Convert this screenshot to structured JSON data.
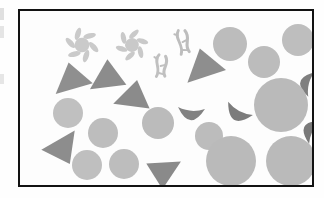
{
  "figure": {
    "title": "",
    "caption": "",
    "frame": {
      "x": 18,
      "y": 9,
      "width": 296,
      "height": 178,
      "border_color": "#121212",
      "border_width": 2,
      "background": "#fdfdfd"
    },
    "palette": {
      "light_gray": "#b9b9b9",
      "light_gray_2": "#c1c1c1",
      "mid_gray": "#8f8f8f",
      "dark_gray": "#777777",
      "pale_gray": "#cfcfcf",
      "page_background": "#ffffff",
      "artifact_gray": "#d9d9d9"
    },
    "legend_note": "",
    "objects": [
      {
        "name": "pinwheel",
        "shape": "pinwheel",
        "cx": 62,
        "cy": 34,
        "r": 16,
        "petals": 6,
        "color": "#cacaca",
        "rotation": 10
      },
      {
        "name": "pinwheel",
        "shape": "pinwheel",
        "cx": 112,
        "cy": 34,
        "r": 15,
        "petals": 6,
        "color": "#c9c9c9",
        "rotation": -20
      },
      {
        "name": "squiggle",
        "shape": "squiggle",
        "cx": 163,
        "cy": 31,
        "w": 22,
        "h": 26,
        "color": "#bdbdbd",
        "rotation": -8
      },
      {
        "name": "squiggle",
        "shape": "squiggle",
        "cx": 141,
        "cy": 55,
        "w": 22,
        "h": 24,
        "color": "#c0c0c0",
        "rotation": 6
      },
      {
        "name": "triangle",
        "shape": "triangle",
        "cx": 53,
        "cy": 66,
        "w": 38,
        "h": 30,
        "color": "#8f8f8f",
        "rotation": -6
      },
      {
        "name": "triangle",
        "shape": "triangle",
        "cx": 89,
        "cy": 64,
        "w": 36,
        "h": 31,
        "color": "#8c8c8c",
        "rotation": 4
      },
      {
        "name": "triangle",
        "shape": "triangle",
        "cx": 115,
        "cy": 84,
        "w": 36,
        "h": 30,
        "color": "#8b8b8b",
        "rotation": 18
      },
      {
        "name": "triangle",
        "shape": "triangle",
        "cx": 185,
        "cy": 53,
        "w": 40,
        "h": 32,
        "color": "#8e8e8e",
        "rotation": -8
      },
      {
        "name": "triangle",
        "shape": "triangle",
        "cx": 42,
        "cy": 140,
        "w": 38,
        "h": 30,
        "color": "#8d8d8d",
        "rotation": 160
      },
      {
        "name": "triangle",
        "shape": "triangle",
        "cx": 142,
        "cy": 163,
        "w": 34,
        "h": 30,
        "color": "#8a8a8a",
        "rotation": 188
      },
      {
        "name": "crescent",
        "shape": "crescent",
        "cx": 171,
        "cy": 104,
        "w": 27,
        "h": 14,
        "color": "#828282",
        "rotation": 4
      },
      {
        "name": "crescent",
        "shape": "crescent",
        "cx": 217,
        "cy": 104,
        "w": 28,
        "h": 15,
        "color": "#7c7c7c",
        "rotation": 28
      },
      {
        "name": "crescent",
        "shape": "crescent",
        "cx": 285,
        "cy": 72,
        "w": 25,
        "h": 13,
        "color": "#7f7f7f",
        "rotation": 104
      },
      {
        "name": "crescent",
        "shape": "crescent",
        "cx": 289,
        "cy": 118,
        "w": 26,
        "h": 14,
        "color": "#7a7a7a",
        "rotation": 118
      },
      {
        "name": "circle",
        "shape": "circle",
        "cx": 210,
        "cy": 33,
        "r": 17,
        "color": "#bcbcbc"
      },
      {
        "name": "circle",
        "shape": "circle",
        "cx": 244,
        "cy": 51,
        "r": 16,
        "color": "#bcbcbc"
      },
      {
        "name": "circle",
        "shape": "circle",
        "cx": 278,
        "cy": 29,
        "r": 16,
        "color": "#bebebe"
      },
      {
        "name": "circle",
        "shape": "circle",
        "cx": 48,
        "cy": 102,
        "r": 15,
        "color": "#c0c0c0"
      },
      {
        "name": "circle",
        "shape": "circle",
        "cx": 83,
        "cy": 122,
        "r": 15,
        "color": "#bdbdbd"
      },
      {
        "name": "circle",
        "shape": "circle",
        "cx": 138,
        "cy": 112,
        "r": 16,
        "color": "#bbbbbb"
      },
      {
        "name": "circle",
        "shape": "circle",
        "cx": 189,
        "cy": 125,
        "r": 14,
        "color": "#bcbcbc"
      },
      {
        "name": "circle",
        "shape": "circle",
        "cx": 261,
        "cy": 94,
        "r": 27,
        "color": "#bababa"
      },
      {
        "name": "circle",
        "shape": "circle",
        "cx": 67,
        "cy": 154,
        "r": 15,
        "color": "#bfbfbf"
      },
      {
        "name": "circle",
        "shape": "circle",
        "cx": 104,
        "cy": 153,
        "r": 15,
        "color": "#bdbdbd"
      },
      {
        "name": "circle",
        "shape": "circle",
        "cx": 211,
        "cy": 150,
        "r": 25,
        "color": "#bababa"
      },
      {
        "name": "circle",
        "shape": "circle",
        "cx": 271,
        "cy": 150,
        "r": 25,
        "color": "#bababa"
      }
    ],
    "artifacts": [
      {
        "name": "scan-artifact",
        "x": 0,
        "y": 8,
        "w": 4,
        "h": 12,
        "color": "#d5d5d5"
      },
      {
        "name": "scan-artifact",
        "x": 0,
        "y": 26,
        "w": 4,
        "h": 12,
        "color": "#dcdcdc"
      },
      {
        "name": "scan-artifact",
        "x": 0,
        "y": 74,
        "w": 4,
        "h": 10,
        "color": "#dedede"
      }
    ]
  }
}
